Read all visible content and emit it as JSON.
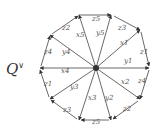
{
  "title": {
    "main": "Q",
    "sup": "∨"
  },
  "diagram": {
    "type": "dodecagon-quiver",
    "center": "central vertex",
    "outer_edges": [
      {
        "label": "z5",
        "position": "top"
      },
      {
        "label": "z3",
        "position": "top-right"
      },
      {
        "label": "z1",
        "position": "right-upper"
      },
      {
        "label": "z4",
        "position": "right-lower"
      },
      {
        "label": "z2",
        "position": "bottom-right"
      },
      {
        "label": "z5",
        "position": "bottom"
      },
      {
        "label": "z3",
        "position": "bottom-left"
      },
      {
        "label": "z1",
        "position": "left-lower"
      },
      {
        "label": "z4",
        "position": "left-upper"
      },
      {
        "label": "z2",
        "position": "top-left"
      }
    ],
    "spokes": [
      {
        "label": "x5",
        "position": "up-left"
      },
      {
        "label": "y5",
        "position": "up-right"
      },
      {
        "label": "x1",
        "position": "right-up"
      },
      {
        "label": "y1",
        "position": "right"
      },
      {
        "label": "x2",
        "position": "right-down"
      },
      {
        "label": "y2",
        "position": "down-right"
      },
      {
        "label": "x3",
        "position": "down-left"
      },
      {
        "label": "y3",
        "position": "left-down"
      },
      {
        "label": "x4",
        "position": "left"
      },
      {
        "label": "y4",
        "position": "left-up"
      }
    ]
  }
}
